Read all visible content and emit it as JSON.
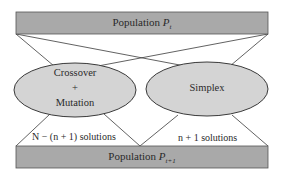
{
  "diagram": {
    "top_bar": {
      "label": "Population",
      "symbol": "P",
      "subscript": "t"
    },
    "bottom_bar": {
      "label": "Population",
      "symbol": "P",
      "subscript": "t+1"
    },
    "left_node": {
      "line1": "Crossover",
      "line2": "+",
      "line3": "Mutation"
    },
    "right_node": {
      "label": "Simplex"
    },
    "left_output": {
      "label": "N − (n + 1) solutions"
    },
    "right_output": {
      "label": "n + 1 solutions"
    },
    "colors": {
      "bar_fill": "#a9a9a9",
      "ellipse_fill": "#d4d4d4",
      "stroke": "#3a3a3a"
    }
  }
}
